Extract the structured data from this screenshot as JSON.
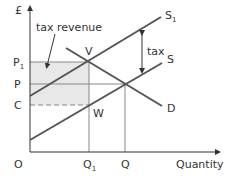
{
  "diagram": {
    "y_axis_label": "£",
    "x_axis_label": "Quantity",
    "origin_label": "O",
    "price_labels": {
      "p1": "P",
      "p1_sub": "1",
      "p": "P",
      "c": "C"
    },
    "quantity_labels": {
      "q1": "Q",
      "q1_sub": "1",
      "q": "Q"
    },
    "curves": {
      "s1": "S",
      "s1_sub": "1",
      "s": "S",
      "d": "D"
    },
    "points": {
      "v": "V",
      "w": "W"
    },
    "annotations": {
      "tax_revenue": "tax revenue",
      "tax": "tax"
    },
    "colors": {
      "line": "#555555",
      "axis": "#333333",
      "shade": "#e8e8e8",
      "guide": "#888888"
    }
  }
}
